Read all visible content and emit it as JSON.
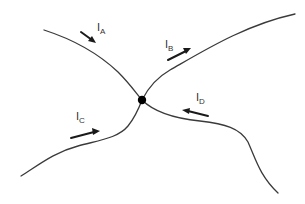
{
  "diagram": {
    "title": "",
    "node": {
      "label": "",
      "x": 142,
      "y": 100,
      "r": 4
    },
    "currents": [
      {
        "id": "A",
        "symbol": "I",
        "subscript": "A",
        "direction": "into-node"
      },
      {
        "id": "B",
        "symbol": "I",
        "subscript": "B",
        "direction": "out-of-node"
      },
      {
        "id": "C",
        "symbol": "I",
        "subscript": "C",
        "direction": "into-node"
      },
      {
        "id": "D",
        "symbol": "I",
        "subscript": "D",
        "direction": "into-node"
      }
    ],
    "colors": {
      "wire": "#3a3a3a",
      "arrow": "#1a1a1a",
      "node": "#000000",
      "background": "#ffffff"
    }
  }
}
